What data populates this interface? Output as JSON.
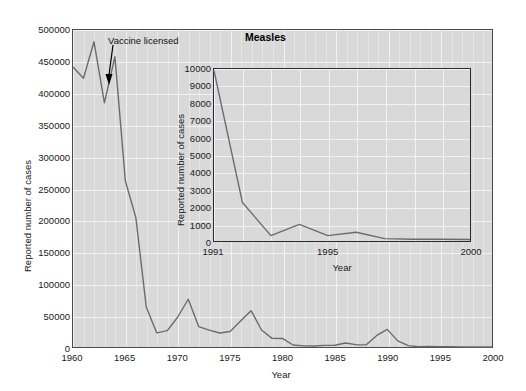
{
  "figure": {
    "title": "Measles",
    "annotation": {
      "label": "Vaccine licensed",
      "icon": "down-arrow-icon",
      "year": 1963
    }
  },
  "main_axes": {
    "xlabel": "Year",
    "ylabel": "Reported number of cases",
    "xticks": [
      "1960",
      "1965",
      "1970",
      "1975",
      "1980",
      "1985",
      "1990",
      "1995",
      "2000"
    ],
    "yticks": [
      "0",
      "50000",
      "100000",
      "150000",
      "200000",
      "250000",
      "300000",
      "350000",
      "400000",
      "450000",
      "500000"
    ]
  },
  "inset_axes": {
    "xlabel": "Year",
    "ylabel": "Reported number of cases",
    "xticks": [
      "1991",
      "1995",
      "2000"
    ],
    "yticks": [
      "0",
      "1000",
      "2000",
      "3000",
      "4000",
      "5000",
      "6000",
      "7000",
      "8000",
      "9000",
      "10000"
    ]
  },
  "colors": {
    "plot_background": "#d9d9d9",
    "gridline": "#f2f2f2",
    "series_line": "#6b6b6b",
    "axis": "#4a4a4a",
    "text": "#1a1a1a"
  },
  "chart_data": [
    {
      "id": "main",
      "type": "line",
      "title": "Measles",
      "xlabel": "Year",
      "ylabel": "Reported number of cases",
      "xlim": [
        1960,
        2000
      ],
      "ylim": [
        0,
        500000
      ],
      "xtick_step": 5,
      "ytick_step": 50000,
      "grid": true,
      "legend": "none",
      "annotations": [
        {
          "text": "Vaccine licensed",
          "x": 1963,
          "y": 410000,
          "arrow": "down"
        }
      ],
      "x": [
        1960,
        1961,
        1962,
        1963,
        1964,
        1965,
        1966,
        1967,
        1968,
        1969,
        1970,
        1971,
        1972,
        1973,
        1974,
        1975,
        1976,
        1977,
        1978,
        1979,
        1980,
        1981,
        1982,
        1983,
        1984,
        1985,
        1986,
        1987,
        1988,
        1989,
        1990,
        1991,
        1992,
        1993,
        1994,
        1995,
        1996,
        1997,
        1998,
        1999,
        2000
      ],
      "y": [
        441703,
        423919,
        481530,
        385156,
        458083,
        261904,
        204136,
        62705,
        22231,
        25826,
        47351,
        75290,
        32275,
        26690,
        22094,
        24374,
        41126,
        57345,
        26871,
        13597,
        13506,
        3124,
        1714,
        1497,
        2587,
        2822,
        6282,
        3655,
        3396,
        18193,
        27786,
        9643,
        2237,
        312,
        963,
        309,
        508,
        138,
        100,
        100,
        86
      ]
    },
    {
      "id": "inset",
      "type": "line",
      "xlabel": "Year",
      "ylabel": "Reported number of cases",
      "xlim": [
        1991,
        2000
      ],
      "ylim": [
        0,
        10000
      ],
      "xtick_step": 1,
      "ytick_step": 1000,
      "grid": true,
      "legend": "none",
      "x": [
        1991,
        1992,
        1993,
        1994,
        1995,
        1996,
        1997,
        1998,
        1999,
        2000
      ],
      "y": [
        9900,
        2237,
        312,
        963,
        309,
        508,
        138,
        100,
        100,
        86
      ]
    }
  ]
}
